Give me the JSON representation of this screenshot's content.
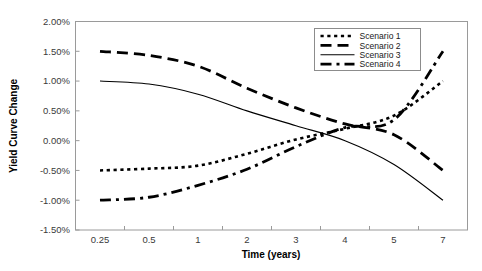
{
  "chart_data": {
    "type": "line",
    "title": "",
    "xlabel": "Time (years)",
    "ylabel": "Yield Curve Change",
    "categories": [
      "0.25",
      "0.5",
      "1",
      "2",
      "3",
      "4",
      "5",
      "7"
    ],
    "x_tick_labels": [
      "0.25",
      "0.5",
      "1",
      "2",
      "3",
      "4",
      "5",
      "7"
    ],
    "y_tick_labels": [
      "2.00%",
      "1.50%",
      "1.00%",
      "0.50%",
      "0.00%",
      "-0.50%",
      "-1.00%",
      "-1.50%"
    ],
    "y_tick_values": [
      2.0,
      1.5,
      1.0,
      0.5,
      0.0,
      -0.5,
      -1.0,
      -1.5
    ],
    "ylim": [
      -1.5,
      2.0
    ],
    "y_unit": "percent",
    "grid": false,
    "legend_position": "top-right",
    "series": [
      {
        "name": "Scenario 1",
        "style": "dotted",
        "values": [
          -0.5,
          -0.47,
          -0.42,
          -0.22,
          0.02,
          0.2,
          0.42,
          1.0
        ]
      },
      {
        "name": "Scenario 2",
        "style": "dashed",
        "values": [
          1.5,
          1.43,
          1.25,
          0.88,
          0.55,
          0.28,
          0.1,
          -0.5
        ]
      },
      {
        "name": "Scenario 3",
        "style": "solid",
        "values": [
          1.0,
          0.95,
          0.78,
          0.5,
          0.25,
          0.0,
          -0.4,
          -1.0
        ]
      },
      {
        "name": "Scenario 4",
        "style": "dash-dot",
        "values": [
          -1.0,
          -0.95,
          -0.75,
          -0.48,
          -0.1,
          0.22,
          0.35,
          1.5
        ]
      }
    ]
  },
  "legend": {
    "entries": [
      {
        "label": "Scenario 1"
      },
      {
        "label": "Scenario 2"
      },
      {
        "label": "Scenario 3"
      },
      {
        "label": "Scenario 4"
      }
    ]
  },
  "colors": {
    "line": "#000000",
    "frame": "#9a9a9a",
    "tick_text": "#3a3a3a",
    "background": "#ffffff"
  }
}
